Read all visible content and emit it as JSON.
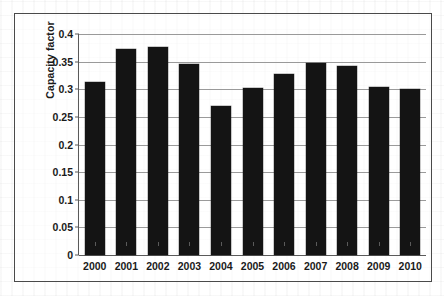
{
  "figure": {
    "bleed_caption": ""
  },
  "chart_data": {
    "type": "bar",
    "title": "",
    "xlabel": "",
    "ylabel": "Capacity factor",
    "categories": [
      "2000",
      "2001",
      "2002",
      "2003",
      "2004",
      "2005",
      "2006",
      "2007",
      "2008",
      "2009",
      "2010"
    ],
    "values": [
      0.313,
      0.373,
      0.376,
      0.345,
      0.269,
      0.302,
      0.328,
      0.348,
      0.342,
      0.305,
      0.301
    ],
    "ylim": [
      0,
      0.4
    ],
    "yticks": [
      0,
      0.05,
      0.1,
      0.15,
      0.2,
      0.25,
      0.3,
      0.35,
      0.4
    ],
    "ytick_labels": [
      "0",
      "0.05",
      "0.1",
      "0.15",
      "0.2",
      "0.25",
      "0.3",
      "0.35",
      "0.4"
    ],
    "grid": true,
    "grid_axis": "y",
    "legend": null,
    "legend_position": "none",
    "bar_color": "#141414",
    "grid_color": "#9a9a9a",
    "axis_color": "#5a5a5a",
    "frame_color": "#4a4a4a",
    "background_color": "#ffffff"
  }
}
